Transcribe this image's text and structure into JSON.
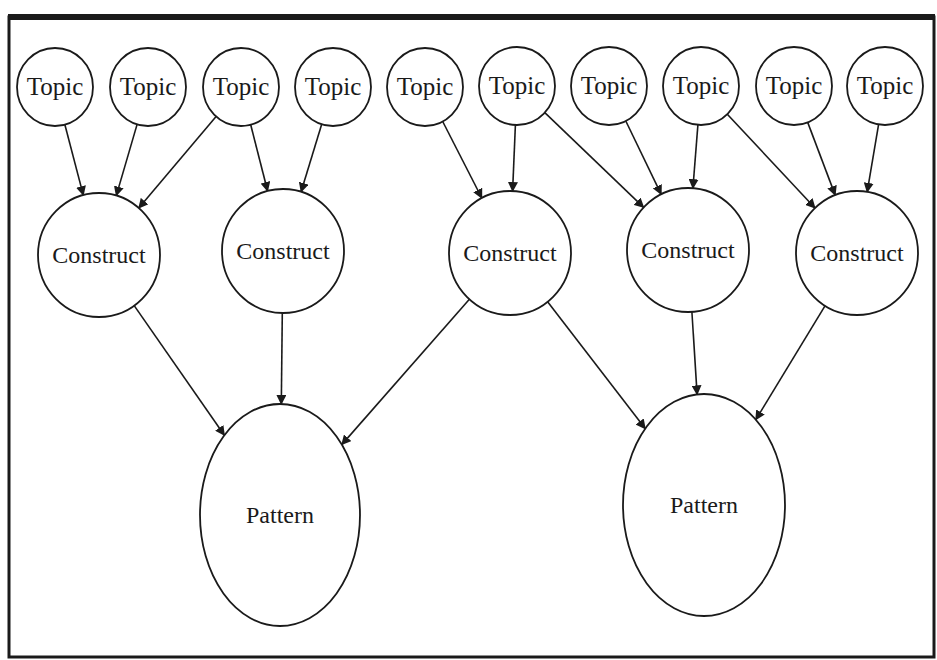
{
  "diagram": {
    "type": "hierarchical-graph",
    "frame": {
      "stroke": "#1a1a1a"
    },
    "colors": {
      "stroke": "#1a1a1a",
      "fill": "#ffffff",
      "text": "#1a1a1a"
    },
    "levels": [
      "Topic",
      "Construct",
      "Pattern"
    ],
    "nodes": [
      {
        "id": "t0",
        "label": "Topic",
        "kind": "topic",
        "cx": 55,
        "cy": 87,
        "rx": 38,
        "ry": 39
      },
      {
        "id": "t1",
        "label": "Topic",
        "kind": "topic",
        "cx": 148,
        "cy": 87,
        "rx": 38,
        "ry": 39
      },
      {
        "id": "t2",
        "label": "Topic",
        "kind": "topic",
        "cx": 241,
        "cy": 87,
        "rx": 38,
        "ry": 39
      },
      {
        "id": "t3",
        "label": "Topic",
        "kind": "topic",
        "cx": 333,
        "cy": 87,
        "rx": 38,
        "ry": 39
      },
      {
        "id": "t4",
        "label": "Topic",
        "kind": "topic",
        "cx": 425,
        "cy": 87,
        "rx": 38,
        "ry": 39
      },
      {
        "id": "t5",
        "label": "Topic",
        "kind": "topic",
        "cx": 517,
        "cy": 86,
        "rx": 38,
        "ry": 39
      },
      {
        "id": "t6",
        "label": "Topic",
        "kind": "topic",
        "cx": 609,
        "cy": 86,
        "rx": 38,
        "ry": 39
      },
      {
        "id": "t7",
        "label": "Topic",
        "kind": "topic",
        "cx": 701,
        "cy": 86,
        "rx": 38,
        "ry": 39
      },
      {
        "id": "t8",
        "label": "Topic",
        "kind": "topic",
        "cx": 794,
        "cy": 86,
        "rx": 38,
        "ry": 39
      },
      {
        "id": "t9",
        "label": "Topic",
        "kind": "topic",
        "cx": 885,
        "cy": 86,
        "rx": 38,
        "ry": 39
      },
      {
        "id": "c0",
        "label": "Construct",
        "kind": "construct",
        "cx": 99,
        "cy": 255,
        "rx": 61,
        "ry": 62
      },
      {
        "id": "c1",
        "label": "Construct",
        "kind": "construct",
        "cx": 283,
        "cy": 251,
        "rx": 61,
        "ry": 62
      },
      {
        "id": "c2",
        "label": "Construct",
        "kind": "construct",
        "cx": 510,
        "cy": 253,
        "rx": 61,
        "ry": 62
      },
      {
        "id": "c3",
        "label": "Construct",
        "kind": "construct",
        "cx": 688,
        "cy": 250,
        "rx": 61,
        "ry": 62
      },
      {
        "id": "c4",
        "label": "Construct",
        "kind": "construct",
        "cx": 857,
        "cy": 253,
        "rx": 61,
        "ry": 62
      },
      {
        "id": "p0",
        "label": "Pattern",
        "kind": "pattern",
        "cx": 280,
        "cy": 515,
        "rx": 80,
        "ry": 111
      },
      {
        "id": "p1",
        "label": "Pattern",
        "kind": "pattern",
        "cx": 704,
        "cy": 505,
        "rx": 81,
        "ry": 111
      }
    ],
    "edges": [
      {
        "from": "t0",
        "to": "c0"
      },
      {
        "from": "t1",
        "to": "c0"
      },
      {
        "from": "t2",
        "to": "c0"
      },
      {
        "from": "t2",
        "to": "c1"
      },
      {
        "from": "t3",
        "to": "c1"
      },
      {
        "from": "t4",
        "to": "c2"
      },
      {
        "from": "t5",
        "to": "c2"
      },
      {
        "from": "t5",
        "to": "c3"
      },
      {
        "from": "t6",
        "to": "c3"
      },
      {
        "from": "t7",
        "to": "c3"
      },
      {
        "from": "t7",
        "to": "c4"
      },
      {
        "from": "t8",
        "to": "c4"
      },
      {
        "from": "t9",
        "to": "c4"
      },
      {
        "from": "c0",
        "to": "p0"
      },
      {
        "from": "c1",
        "to": "p0"
      },
      {
        "from": "c2",
        "to": "p0"
      },
      {
        "from": "c2",
        "to": "p1"
      },
      {
        "from": "c3",
        "to": "p1"
      },
      {
        "from": "c4",
        "to": "p1"
      }
    ]
  }
}
